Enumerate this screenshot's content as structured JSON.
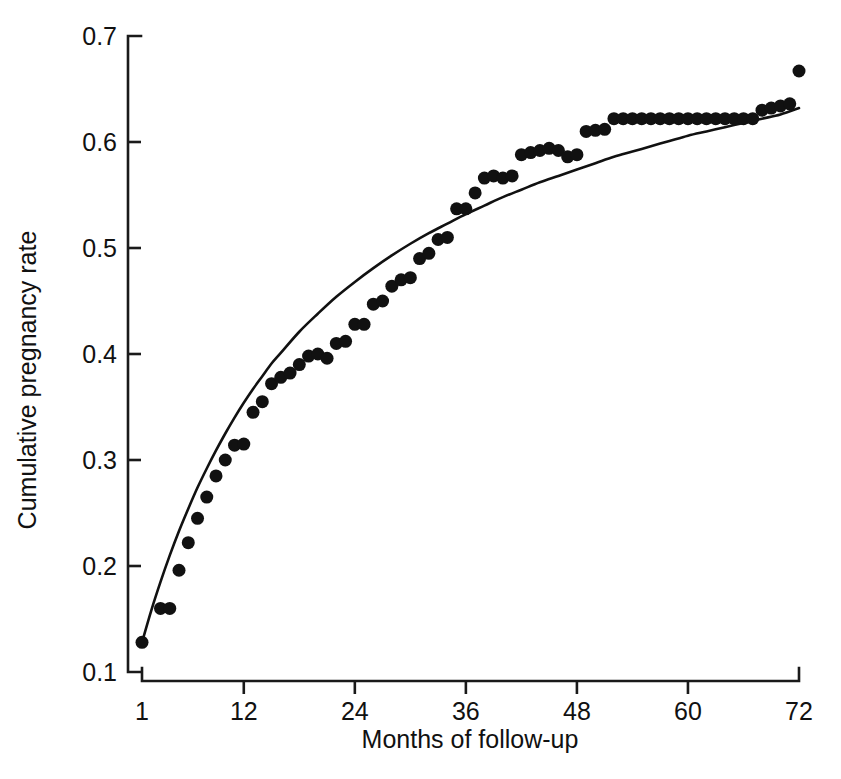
{
  "chart_data": {
    "type": "scatter",
    "title": "",
    "subtitle": "",
    "xlabel": "Months of follow-up",
    "ylabel": "Cumulative pregnancy rate",
    "xlim": [
      1,
      72
    ],
    "ylim": [
      0.1,
      0.7
    ],
    "xticks": [
      1,
      12,
      24,
      36,
      48,
      60,
      72
    ],
    "xtick_labels": [
      "1",
      "12",
      "24",
      "36",
      "48",
      "60",
      "72"
    ],
    "yticks": [
      0.1,
      0.2,
      0.3,
      0.4,
      0.5,
      0.6,
      0.7
    ],
    "ytick_labels": [
      "0.1",
      "0.2",
      "0.3",
      "0.4",
      "0.5",
      "0.6",
      "0.7"
    ],
    "grid": false,
    "legend": null,
    "marker": "filled-circle",
    "marker_color": "#111111",
    "marker_size_px": 13,
    "curve_color": "#111111",
    "annotations": [],
    "series": [
      {
        "name": "Observed cumulative pregnancy rate",
        "type": "scatter",
        "x": [
          1,
          3,
          4,
          5,
          6,
          7,
          8,
          9,
          10,
          11,
          12,
          13,
          14,
          15,
          16,
          17,
          18,
          19,
          20,
          21,
          22,
          23,
          24,
          25,
          26,
          27,
          28,
          29,
          30,
          31,
          32,
          33,
          34,
          35,
          36,
          37,
          38,
          39,
          40,
          41,
          42,
          43,
          44,
          45,
          46,
          47,
          48,
          49,
          50,
          51,
          52,
          53,
          54,
          55,
          56,
          57,
          58,
          59,
          60,
          61,
          62,
          63,
          64,
          65,
          66,
          67,
          68,
          69,
          70,
          71,
          72
        ],
        "y": [
          0.128,
          0.16,
          0.16,
          0.196,
          0.222,
          0.245,
          0.265,
          0.285,
          0.3,
          0.314,
          0.315,
          0.345,
          0.355,
          0.372,
          0.378,
          0.382,
          0.39,
          0.398,
          0.4,
          0.396,
          0.41,
          0.412,
          0.428,
          0.428,
          0.447,
          0.45,
          0.464,
          0.47,
          0.472,
          0.49,
          0.495,
          0.508,
          0.51,
          0.537,
          0.537,
          0.552,
          0.566,
          0.568,
          0.566,
          0.568,
          0.588,
          0.59,
          0.592,
          0.594,
          0.592,
          0.586,
          0.588,
          0.61,
          0.611,
          0.612,
          0.622,
          0.622,
          0.622,
          0.622,
          0.622,
          0.622,
          0.622,
          0.622,
          0.622,
          0.622,
          0.622,
          0.622,
          0.622,
          0.622,
          0.622,
          0.622,
          0.63,
          0.632,
          0.634,
          0.636,
          0.667
        ]
      },
      {
        "name": "Fitted curve",
        "type": "line",
        "x": [
          1,
          2,
          3,
          4,
          5,
          6,
          7,
          8,
          9,
          10,
          11,
          12,
          13,
          14,
          15,
          16,
          18,
          20,
          22,
          24,
          26,
          28,
          30,
          32,
          34,
          36,
          38,
          40,
          42,
          44,
          46,
          48,
          50,
          52,
          54,
          56,
          58,
          60,
          62,
          64,
          66,
          68,
          70,
          72
        ],
        "y": [
          0.128,
          0.158,
          0.185,
          0.21,
          0.233,
          0.254,
          0.274,
          0.292,
          0.309,
          0.325,
          0.34,
          0.354,
          0.367,
          0.379,
          0.391,
          0.401,
          0.421,
          0.438,
          0.454,
          0.468,
          0.481,
          0.493,
          0.504,
          0.514,
          0.523,
          0.532,
          0.54,
          0.548,
          0.555,
          0.562,
          0.568,
          0.574,
          0.58,
          0.586,
          0.591,
          0.596,
          0.601,
          0.606,
          0.61,
          0.614,
          0.618,
          0.622,
          0.626,
          0.632
        ]
      }
    ]
  },
  "axes": {
    "x_axis_name": "months-of-follow-up-axis",
    "y_axis_name": "cumulative-pregnancy-rate-axis"
  }
}
